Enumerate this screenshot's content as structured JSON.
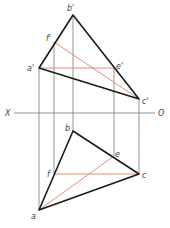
{
  "diagram": {
    "type": "orthographic-projection",
    "axis": {
      "left_label": "X",
      "right_label": "O",
      "y": 113,
      "x1": 14,
      "x2": 155
    },
    "front_view": {
      "points": {
        "b_prime": {
          "label": "b'",
          "x": 73,
          "y": 15
        },
        "f_prime": {
          "label": "f'",
          "x": 54,
          "y": 42
        },
        "a_prime": {
          "label": "a'",
          "x": 39,
          "y": 68
        },
        "e_prime": {
          "label": "e'",
          "x": 114,
          "y": 68
        },
        "c_prime": {
          "label": "c'",
          "x": 139,
          "y": 99
        }
      }
    },
    "top_view": {
      "points": {
        "b": {
          "label": "b",
          "x": 73,
          "y": 131
        },
        "e": {
          "label": "e",
          "x": 114,
          "y": 156
        },
        "f": {
          "label": "f",
          "x": 54,
          "y": 174
        },
        "c": {
          "label": "c",
          "x": 139,
          "y": 174
        },
        "a": {
          "label": "a",
          "x": 39,
          "y": 210
        }
      }
    },
    "colors": {
      "outline": "#1a1a1a",
      "projection": "#555555",
      "highlight": "#d9826a"
    }
  }
}
